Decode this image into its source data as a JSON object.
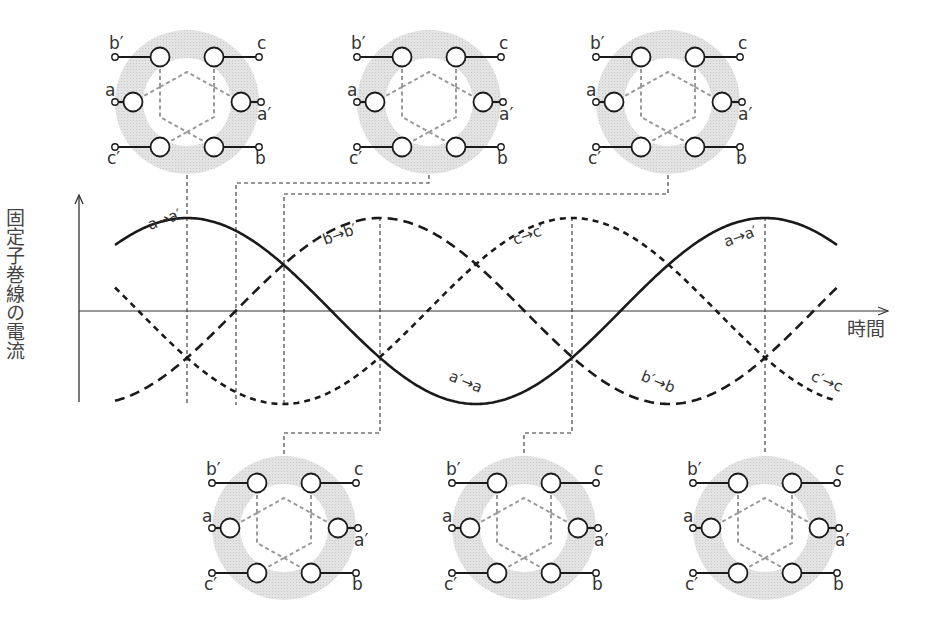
{
  "axes": {
    "y_label": "固定子巻線の電流",
    "x_label": "時間",
    "origin_x": 79,
    "zero_y": 311,
    "y_top": 195,
    "y_bottom": 402,
    "x_end": 888
  },
  "waves": {
    "x_start": 115,
    "x_end": 838,
    "amplitude": 93,
    "period": 578,
    "series": [
      {
        "name": "a",
        "peak_x": 187,
        "style": "solid",
        "label_pos": "a→a′",
        "label_neg": "a′→a"
      },
      {
        "name": "b",
        "peak_x": 380,
        "style": "dashed-long",
        "label_pos": "b→b′",
        "label_neg": "b′→b"
      },
      {
        "name": "c",
        "peak_x": 572,
        "style": "dashed-short",
        "label_pos": "c→c′",
        "label_neg": "c′→c"
      }
    ]
  },
  "curve_labels": [
    {
      "text": "a→a′",
      "x": 150,
      "y": 230,
      "rot": -20
    },
    {
      "text": "b→b′",
      "x": 325,
      "y": 245,
      "rot": -20
    },
    {
      "text": "c→c′",
      "x": 515,
      "y": 245,
      "rot": -20
    },
    {
      "text": "a→a′",
      "x": 726,
      "y": 247,
      "rot": -20
    },
    {
      "text": "a′→a",
      "x": 448,
      "y": 380,
      "rot": 22
    },
    {
      "text": "b′→b",
      "x": 640,
      "y": 380,
      "rot": 22
    },
    {
      "text": "c′→c",
      "x": 810,
      "y": 380,
      "rot": 22
    }
  ],
  "stator": {
    "terminal_labels": {
      "top_left": "b′",
      "top_right": "c",
      "mid_left": "a",
      "mid_right": "a′",
      "bot_left": "c′",
      "bot_right": "b"
    },
    "ring_color": "#d9d9d9",
    "diagrams": [
      {
        "id": "top-1",
        "cx": 187,
        "cy": 102
      },
      {
        "id": "top-2",
        "cx": 429,
        "cy": 102
      },
      {
        "id": "top-3",
        "cx": 668,
        "cy": 102
      },
      {
        "id": "bottom-1",
        "cx": 284,
        "cy": 528
      },
      {
        "id": "bottom-2",
        "cx": 524,
        "cy": 528
      },
      {
        "id": "bottom-3",
        "cx": 765,
        "cy": 528
      }
    ]
  },
  "connectors": [
    {
      "id": "t1",
      "points": [
        [
          187,
          175
        ],
        [
          187,
          405
        ]
      ]
    },
    {
      "id": "t2",
      "points": [
        [
          429,
          175
        ],
        [
          429,
          183
        ],
        [
          236,
          183
        ],
        [
          236,
          405
        ]
      ]
    },
    {
      "id": "t3",
      "points": [
        [
          668,
          175
        ],
        [
          668,
          194
        ],
        [
          284,
          194
        ],
        [
          284,
          405
        ]
      ]
    },
    {
      "id": "b1",
      "points": [
        [
          380,
          217
        ],
        [
          380,
          433
        ],
        [
          284,
          433
        ],
        [
          284,
          455
        ]
      ]
    },
    {
      "id": "b2",
      "points": [
        [
          572,
          217
        ],
        [
          572,
          433
        ],
        [
          524,
          433
        ],
        [
          524,
          455
        ]
      ]
    },
    {
      "id": "b3",
      "points": [
        [
          765,
          217
        ],
        [
          765,
          455
        ]
      ]
    }
  ]
}
